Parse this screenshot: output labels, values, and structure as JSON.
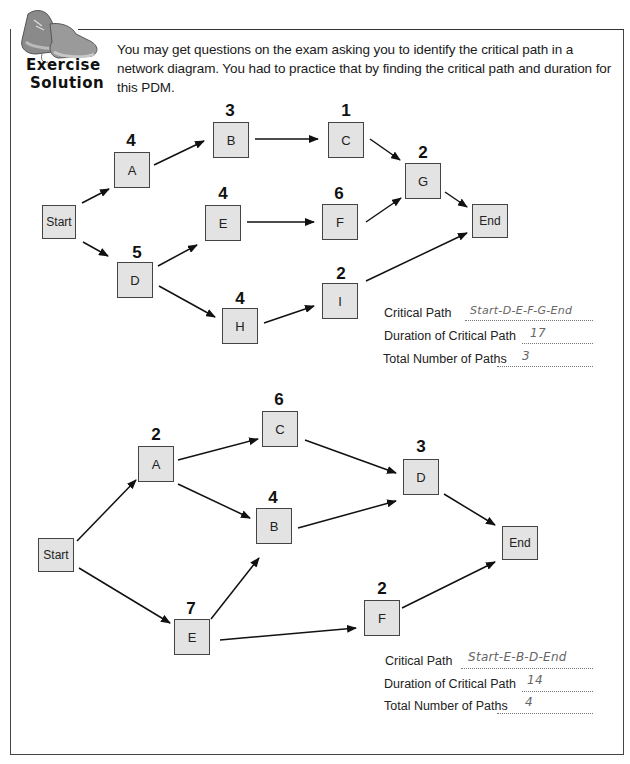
{
  "badge": {
    "line1": "Exercise",
    "line2": "Solution",
    "icon": "sneakers-icon"
  },
  "intro": {
    "text": "You may get questions on the exam asking you to identify the critical path in a network diagram. You had to practice that by finding the critical path and duration for this PDM."
  },
  "diagram1": {
    "nodes": {
      "start": {
        "label": "Start"
      },
      "A": {
        "label": "A",
        "duration": "4"
      },
      "B": {
        "label": "B",
        "duration": "3"
      },
      "C": {
        "label": "C",
        "duration": "1"
      },
      "D": {
        "label": "D",
        "duration": "5"
      },
      "E": {
        "label": "E",
        "duration": "4"
      },
      "F": {
        "label": "F",
        "duration": "6"
      },
      "G": {
        "label": "G",
        "duration": "2"
      },
      "H": {
        "label": "H",
        "duration": "4"
      },
      "I": {
        "label": "I",
        "duration": "2"
      },
      "end": {
        "label": "End"
      }
    },
    "edges": [
      [
        "Start",
        "A"
      ],
      [
        "A",
        "B"
      ],
      [
        "B",
        "C"
      ],
      [
        "C",
        "G"
      ],
      [
        "Start",
        "D"
      ],
      [
        "D",
        "E"
      ],
      [
        "E",
        "F"
      ],
      [
        "F",
        "G"
      ],
      [
        "G",
        "End"
      ],
      [
        "D",
        "H"
      ],
      [
        "H",
        "I"
      ],
      [
        "I",
        "End"
      ]
    ],
    "answers": {
      "critical_path_label": "Critical Path",
      "critical_path_value": "Start-D-E-F-G-End",
      "duration_label": "Duration of Critical Path",
      "duration_value": "17",
      "total_paths_label": "Total Number of Paths",
      "total_paths_value": "3"
    }
  },
  "diagram2": {
    "nodes": {
      "start": {
        "label": "Start"
      },
      "A": {
        "label": "A",
        "duration": "2"
      },
      "B": {
        "label": "B",
        "duration": "4"
      },
      "C": {
        "label": "C",
        "duration": "6"
      },
      "D": {
        "label": "D",
        "duration": "3"
      },
      "E": {
        "label": "E",
        "duration": "7"
      },
      "F": {
        "label": "F",
        "duration": "2"
      },
      "end": {
        "label": "End"
      }
    },
    "edges": [
      [
        "Start",
        "A"
      ],
      [
        "A",
        "C"
      ],
      [
        "A",
        "B"
      ],
      [
        "C",
        "D"
      ],
      [
        "B",
        "D"
      ],
      [
        "D",
        "End"
      ],
      [
        "Start",
        "E"
      ],
      [
        "E",
        "B"
      ],
      [
        "E",
        "F"
      ],
      [
        "F",
        "End"
      ]
    ],
    "answers": {
      "critical_path_label": "Critical Path",
      "critical_path_value": "Start-E-B-D-End",
      "duration_label": "Duration of Critical Path",
      "duration_value": "14",
      "total_paths_label": "Total Number of Paths",
      "total_paths_value": "4"
    }
  },
  "colors": {
    "node_fill": "#e3e3e3",
    "node_border": "#444444",
    "handwriting": "#666666"
  }
}
